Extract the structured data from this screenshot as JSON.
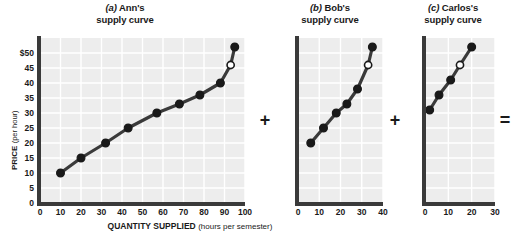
{
  "figure": {
    "axis_title_x_main": "QUANTITY SUPPLIED",
    "axis_title_x_sub": "(hours per semester)",
    "axis_title_y_main": "PRICE",
    "axis_title_y_sub": "(per hour)",
    "operator_plus_1": "+",
    "operator_plus_2": "+",
    "operator_equals": "="
  },
  "chart_data": [
    {
      "type": "line",
      "panel": "a",
      "title": "(a) Ann's supply curve",
      "title_letter": "(a)",
      "title_rest": " Ann's",
      "title_line2": "supply curve",
      "xlabel": "QUANTITY SUPPLIED (hours per semester)",
      "ylabel": "PRICE (per hour)",
      "xlim": [
        0,
        100
      ],
      "ylim": [
        0,
        55
      ],
      "xticks": [
        "0",
        "10",
        "20",
        "30",
        "40",
        "50",
        "60",
        "70",
        "80",
        "90",
        "100"
      ],
      "xtick_values": [
        0,
        10,
        20,
        30,
        40,
        50,
        60,
        70,
        80,
        90,
        100
      ],
      "yticks": [
        "$50",
        "45",
        "40",
        "35",
        "30",
        "25",
        "20",
        "15",
        "10",
        "5",
        "0"
      ],
      "ytick_values": [
        50,
        45,
        40,
        35,
        30,
        25,
        20,
        15,
        10,
        5,
        0
      ],
      "grid": true,
      "legend": "none",
      "points": [
        {
          "x": 10,
          "y": 10,
          "marker": "filled"
        },
        {
          "x": 20,
          "y": 15,
          "marker": "filled"
        },
        {
          "x": 32,
          "y": 20,
          "marker": "filled"
        },
        {
          "x": 43,
          "y": 25,
          "marker": "filled"
        },
        {
          "x": 57,
          "y": 30,
          "marker": "filled"
        },
        {
          "x": 68,
          "y": 33,
          "marker": "filled"
        },
        {
          "x": 78,
          "y": 36,
          "marker": "filled"
        },
        {
          "x": 88,
          "y": 40,
          "marker": "filled"
        },
        {
          "x": 93,
          "y": 46,
          "marker": "open"
        },
        {
          "x": 95,
          "y": 52,
          "marker": "filled"
        }
      ]
    },
    {
      "type": "line",
      "panel": "b",
      "title": "(b) Bob's supply curve",
      "title_letter": "(b)",
      "title_rest": " Bob's",
      "title_line2": "supply curve",
      "xlim": [
        0,
        40
      ],
      "ylim": [
        0,
        55
      ],
      "xticks": [
        "0",
        "10",
        "20",
        "30",
        "40"
      ],
      "xtick_values": [
        0,
        10,
        20,
        30,
        40
      ],
      "grid": true,
      "legend": "none",
      "points": [
        {
          "x": 6,
          "y": 20,
          "marker": "filled"
        },
        {
          "x": 12,
          "y": 25,
          "marker": "filled"
        },
        {
          "x": 18,
          "y": 30,
          "marker": "filled"
        },
        {
          "x": 23,
          "y": 33,
          "marker": "filled"
        },
        {
          "x": 28,
          "y": 38,
          "marker": "filled"
        },
        {
          "x": 33,
          "y": 46,
          "marker": "open"
        },
        {
          "x": 35,
          "y": 52,
          "marker": "filled"
        }
      ]
    },
    {
      "type": "line",
      "panel": "c",
      "title": "(c) Carlos's supply curve",
      "title_letter": "(c)",
      "title_rest": " Carlos's",
      "title_line2": "supply curve",
      "xlim": [
        0,
        30
      ],
      "ylim": [
        0,
        55
      ],
      "xticks": [
        "0",
        "10",
        "20",
        "30"
      ],
      "xtick_values": [
        0,
        10,
        20,
        30
      ],
      "grid": true,
      "legend": "none",
      "points": [
        {
          "x": 2,
          "y": 31,
          "marker": "filled"
        },
        {
          "x": 6,
          "y": 36,
          "marker": "filled"
        },
        {
          "x": 11,
          "y": 41,
          "marker": "filled"
        },
        {
          "x": 15,
          "y": 46,
          "marker": "open"
        },
        {
          "x": 20,
          "y": 52,
          "marker": "filled"
        }
      ]
    }
  ]
}
